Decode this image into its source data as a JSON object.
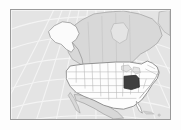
{
  "widget": {
    "name": "locator-map-thumbnail",
    "title": "North America Locator Map",
    "alt_text": "Map of North America with one U.S. state highlighted"
  },
  "frame": {
    "border_color": "#9a9a9a",
    "outer_margin_color": "#fdfdfd"
  },
  "map": {
    "projection": "conic",
    "ocean_color": "#e4e4e4",
    "graticule_color": "#f4f4f4",
    "graticule_visible": true,
    "coastline_color": "#8f8f8f",
    "regions": [
      {
        "id": "canada",
        "label": "Canada",
        "fill": "#d8d8d8",
        "stroke": "#999999"
      },
      {
        "id": "mexico",
        "label": "Mexico",
        "fill": "#d8d8d8",
        "stroke": "#999999"
      },
      {
        "id": "greenland",
        "label": "Greenland",
        "fill": "#dcdcdc",
        "stroke": "#a5a5a5"
      },
      {
        "id": "alaska",
        "label": "Alaska",
        "fill": "#fbfbfb",
        "stroke": "#8a8a8a"
      },
      {
        "id": "conus",
        "label": "Contiguous United States",
        "fill": "#fdfdfd",
        "stroke": "#7f7f7f"
      }
    ],
    "state_border_color": "#b4b4b4",
    "highlight": {
      "id": "highlighted-state",
      "label": "Highlighted State",
      "fill": "#3f3f3f",
      "stroke": "#2a2a2a",
      "approx_center_x": 122,
      "approx_center_y": 76
    }
  }
}
